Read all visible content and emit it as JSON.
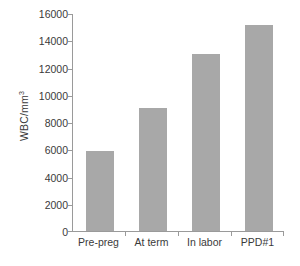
{
  "chart_data": {
    "type": "bar",
    "title": "",
    "xlabel": "",
    "ylabel": "WBC/mm3",
    "ylabel_base": "WBC/mm",
    "ylabel_sup": "3",
    "categories": [
      "Pre-preg",
      "At term",
      "In labor",
      "PPD#1"
    ],
    "values": [
      5900,
      9000,
      13000,
      15100
    ],
    "ylim": [
      0,
      16000
    ],
    "ytick_step": 2000,
    "yticks": [
      0,
      2000,
      4000,
      6000,
      8000,
      10000,
      12000,
      14000,
      16000
    ],
    "ytick_labels": [
      "0",
      "2000",
      "4000",
      "6000",
      "8000",
      "10000",
      "12000",
      "14000",
      "16000"
    ],
    "grid": false,
    "legend": false,
    "legend_position": "none",
    "series": [
      {
        "name": "WBC count",
        "values": [
          5900,
          9000,
          13000,
          15100
        ]
      }
    ],
    "colors": {
      "bar_fill": "#a8a8a8",
      "axis_line": "#9a9a9a",
      "text": "#3a3a3a",
      "background": "#ffffff"
    }
  }
}
